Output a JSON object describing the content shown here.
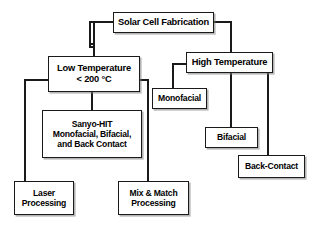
{
  "diagram": {
    "title": "Solar Cell Fabrication",
    "type": "flowchart",
    "orientation": "top-down",
    "line_color": "#1a1a1a",
    "box_fill": "#ffffff",
    "text_color": "#000000",
    "nodes": {
      "root": {
        "label": "Solar Cell Fabrication"
      },
      "low_temperature": {
        "label": "Low Temperature\n< 200 °C"
      },
      "high_temperature": {
        "label": "High Temperature"
      },
      "sanyo_hit": {
        "label": "Sanyo-HIT\nMonofacial, Bifacial,\nand Back Contact"
      },
      "monofacial": {
        "label": "Monofacial"
      },
      "bifacial": {
        "label": "Bifacial"
      },
      "back_contact": {
        "label": "Back-Contact"
      },
      "laser_processing": {
        "label": "Laser\nProcessing"
      },
      "mix_match_processing": {
        "label": "Mix & Match\nProcessing"
      }
    },
    "edges": [
      {
        "from": "root",
        "to": "low_temperature"
      },
      {
        "from": "root",
        "to": "high_temperature"
      },
      {
        "from": "low_temperature",
        "to": "sanyo_hit"
      },
      {
        "from": "low_temperature",
        "to": "laser_processing"
      },
      {
        "from": "low_temperature",
        "to": "mix_match_processing"
      },
      {
        "from": "high_temperature",
        "to": "monofacial"
      },
      {
        "from": "high_temperature",
        "to": "bifacial"
      },
      {
        "from": "high_temperature",
        "to": "back_contact"
      }
    ]
  }
}
